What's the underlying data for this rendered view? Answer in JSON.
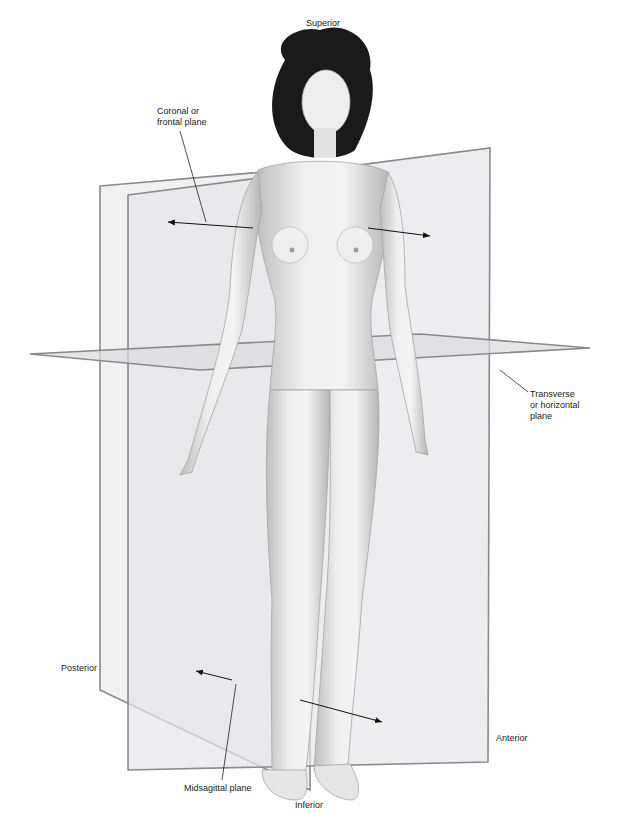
{
  "diagram": {
    "labels": {
      "superior": "Superior",
      "inferior": "Inferior",
      "anterior": "Anterior",
      "posterior": "Posterior",
      "coronal": "Coronal or\nfrontal plane",
      "transverse": "Transverse\nor horizontal\nplane",
      "midsagittal": "Midsagittal plane"
    },
    "colors": {
      "plane_fill": "#e9e9eb",
      "plane_edge": "#8a8a8e",
      "skin_light": "#f2f2f2",
      "skin_shadow": "#b8b8b8",
      "hair": "#1a1a1a",
      "leader_line": "#222222"
    }
  }
}
